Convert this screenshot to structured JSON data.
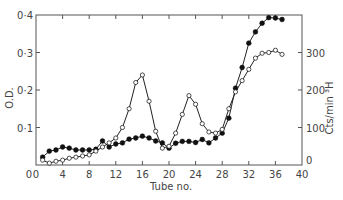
{
  "chart_data": {
    "type": "line",
    "title": "",
    "xlabel": "Tube no.",
    "ylabel_left": "O.D.",
    "ylabel_right": "Cts/min ³H",
    "xlim": [
      0,
      40
    ],
    "ylim_left": [
      0,
      0.4
    ],
    "ylim_right": [
      0,
      400
    ],
    "x_ticks": [
      0,
      4,
      8,
      12,
      16,
      20,
      24,
      28,
      32,
      36,
      40
    ],
    "x_tick_labels": [
      "0",
      "4",
      "8",
      "12",
      "16",
      "20",
      "24",
      "28",
      "32",
      "36",
      "40"
    ],
    "y_left_ticks": [
      0,
      0.1,
      0.2,
      0.3,
      0.4
    ],
    "y_left_tick_labels": [
      "0",
      "0·1",
      "0·2",
      "0·3",
      "0·4"
    ],
    "y_right_ticks": [
      0,
      100,
      200,
      300
    ],
    "y_right_tick_labels": [
      "0",
      "100",
      "200",
      "300"
    ],
    "grid": false,
    "legend": null,
    "x": [
      1,
      2,
      3,
      4,
      5,
      6,
      7,
      8,
      9,
      10,
      11,
      12,
      13,
      14,
      15,
      16,
      17,
      18,
      19,
      20,
      21,
      22,
      23,
      24,
      25,
      26,
      27,
      28,
      29,
      30,
      31,
      32,
      33,
      34,
      35,
      36,
      37
    ],
    "series": [
      {
        "name": "O.D. (filled circles)",
        "axis": "left",
        "marker": "filled-circle",
        "values": [
          0.021,
          0.037,
          0.04,
          0.048,
          0.045,
          0.04,
          0.04,
          0.04,
          0.042,
          0.064,
          0.048,
          0.056,
          0.059,
          0.069,
          0.072,
          0.077,
          0.072,
          0.064,
          0.059,
          0.045,
          0.058,
          0.063,
          0.063,
          0.06,
          0.068,
          0.059,
          0.072,
          0.085,
          0.125,
          0.205,
          0.26,
          0.325,
          0.355,
          0.378,
          0.393,
          0.392,
          0.388
        ]
      },
      {
        "name": "Cts/min ³H (open circles)",
        "axis": "right",
        "marker": "open-circle",
        "values": [
          13,
          5,
          10,
          13,
          18,
          21,
          24,
          27,
          37,
          48,
          59,
          72,
          100,
          150,
          220,
          240,
          170,
          90,
          45,
          50,
          85,
          135,
          185,
          162,
          110,
          88,
          85,
          95,
          150,
          195,
          225,
          255,
          285,
          298,
          300,
          306,
          295
        ]
      }
    ]
  }
}
